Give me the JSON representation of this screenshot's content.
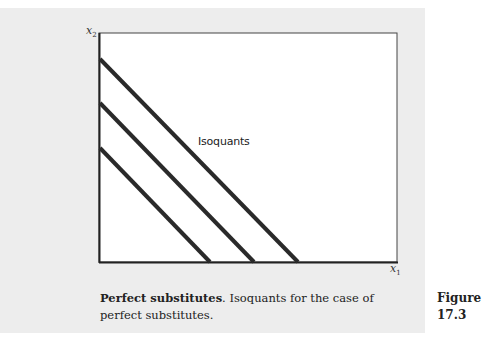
{
  "chart_data": {
    "type": "line",
    "title": "Perfect substitutes",
    "xlabel": "x1",
    "ylabel": "x2",
    "grid": false,
    "legend": null,
    "annotation": "Isoquants",
    "xlim": [
      0,
      297
    ],
    "ylim": [
      0,
      229
    ],
    "series": [
      {
        "name": "Isoquant 1",
        "points": [
          [
            0,
            114
          ],
          [
            110,
            0
          ]
        ]
      },
      {
        "name": "Isoquant 2",
        "points": [
          [
            0,
            159
          ],
          [
            154,
            0
          ]
        ]
      },
      {
        "name": "Isoquant 3",
        "points": [
          [
            0,
            203
          ],
          [
            198,
            0
          ]
        ]
      }
    ]
  },
  "figure": {
    "axis_x_label_base": "x",
    "axis_x_label_sub": "1",
    "axis_y_label_base": "x",
    "axis_y_label_sub": "2",
    "annotation": "Isoquants",
    "caption_bold": "Perfect substitutes",
    "caption_text": ". Isoquants for the case of perfect substitutes.",
    "figure_word": "Figure",
    "figure_number": "17.3"
  },
  "colors": {
    "panel_bg": "#ededed",
    "plot_bg": "#ffffff",
    "line": "#2a2a2a",
    "text": "#222222"
  }
}
